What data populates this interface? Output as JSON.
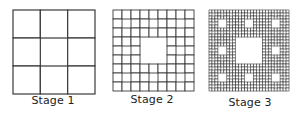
{
  "diagram": {
    "line_color": "#3a3a3a",
    "stages": [
      {
        "label": "Stage 1",
        "iteration": 1,
        "grid_divisions": 3,
        "box": {
          "x": 12,
          "y": 9,
          "w": 82,
          "h": 84
        },
        "label_pos": {
          "x": 53,
          "y": 95
        }
      },
      {
        "label": "Stage 2",
        "iteration": 2,
        "grid_divisions": 9,
        "box": {
          "x": 112,
          "y": 9,
          "w": 81,
          "h": 81
        },
        "label_pos": {
          "x": 152,
          "y": 94
        }
      },
      {
        "label": "Stage 3",
        "iteration": 3,
        "grid_divisions": 27,
        "box": {
          "x": 208,
          "y": 9,
          "w": 80,
          "h": 81
        },
        "label_pos": {
          "x": 250,
          "y": 97
        }
      }
    ]
  }
}
